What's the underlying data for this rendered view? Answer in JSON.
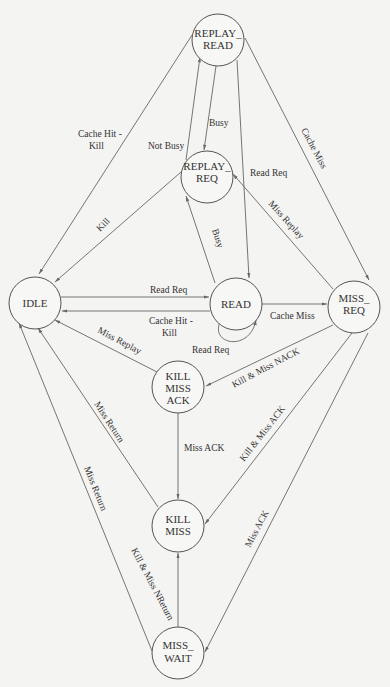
{
  "diagram": {
    "type": "state-machine",
    "nodes": {
      "replay_read": {
        "line1": "REPLAY_",
        "line2": "READ"
      },
      "replay_req": {
        "line1": "REPLAY_",
        "line2": "REQ"
      },
      "idle": {
        "line1": "IDLE"
      },
      "read": {
        "line1": "READ"
      },
      "miss_req": {
        "line1": "MISS_",
        "line2": "REQ"
      },
      "kill_miss_ack": {
        "line1": "KILL",
        "line2": "MISS",
        "line3": "ACK"
      },
      "kill_miss": {
        "line1": "KILL",
        "line2": "MISS"
      },
      "miss_wait": {
        "line1": "MISS_",
        "line2": "WAIT"
      }
    },
    "edges": [
      {
        "id": "rr_idle",
        "from": "REPLAY_READ",
        "to": "IDLE",
        "label1": "Cache Hit -",
        "label2": "Kill"
      },
      {
        "id": "rr_rq",
        "from": "REPLAY_READ",
        "to": "REPLAY_REQ",
        "label": "Busy"
      },
      {
        "id": "rq_rr",
        "from": "REPLAY_REQ",
        "to": "REPLAY_READ",
        "label": "Not Busy"
      },
      {
        "id": "rr_read",
        "from": "REPLAY_READ",
        "to": "READ",
        "label": "Read Req"
      },
      {
        "id": "rr_mreq",
        "from": "REPLAY_READ",
        "to": "MISS_REQ",
        "label": "Cache Miss"
      },
      {
        "id": "rq_idle",
        "from": "REPLAY_REQ",
        "to": "IDLE",
        "label": "Kill"
      },
      {
        "id": "read_rq",
        "from": "READ",
        "to": "REPLAY_REQ",
        "label": "Busy"
      },
      {
        "id": "mreq_rq",
        "from": "MISS_REQ",
        "to": "REPLAY_REQ",
        "label": "Miss Replay"
      },
      {
        "id": "idle_read",
        "from": "IDLE",
        "to": "READ",
        "label": "Read Req"
      },
      {
        "id": "read_idle",
        "from": "READ",
        "to": "IDLE",
        "label1": "Cache Hit -",
        "label2": "Kill"
      },
      {
        "id": "read_self",
        "from": "READ",
        "to": "READ",
        "label": "Read Req"
      },
      {
        "id": "read_mreq",
        "from": "READ",
        "to": "MISS_REQ",
        "label": "Cache Miss"
      },
      {
        "id": "kma_idle",
        "from": "KILL MISS ACK",
        "to": "IDLE",
        "label": "Miss Replay"
      },
      {
        "id": "mreq_kma",
        "from": "MISS_REQ",
        "to": "KILL MISS ACK",
        "label": "Kill & Miss NACK"
      },
      {
        "id": "kma_km",
        "from": "KILL MISS ACK",
        "to": "KILL MISS",
        "label": "Miss ACK"
      },
      {
        "id": "mreq_km",
        "from": "MISS_REQ",
        "to": "KILL MISS",
        "label": "Kill & Miss ACK"
      },
      {
        "id": "km_idle",
        "from": "KILL MISS",
        "to": "IDLE",
        "label": "Miss Return"
      },
      {
        "id": "mw_idle",
        "from": "MISS_WAIT",
        "to": "IDLE",
        "label": "Miss Return"
      },
      {
        "id": "mw_km",
        "from": "MISS_WAIT",
        "to": "KILL MISS",
        "label": "Kill & Miss NReturn"
      },
      {
        "id": "mreq_mw",
        "from": "MISS_REQ",
        "to": "MISS_WAIT",
        "label": "Miss ACK"
      }
    ],
    "edge_labels": {
      "rr_idle": {
        "label1": "Cache Hit -",
        "label2": "Kill"
      },
      "rr_rq": "Busy",
      "rq_rr": "Not Busy",
      "rr_read": "Read Req",
      "rr_mreq": "Cache Miss",
      "rq_idle": "Kill",
      "read_rq": "Busy",
      "mreq_rq": "Miss Replay",
      "idle_read": "Read Req",
      "read_idle": {
        "label1": "Cache Hit -",
        "label2": "Kill"
      },
      "read_self": "Read Req",
      "read_mreq": "Cache Miss",
      "kma_idle": "Miss Replay",
      "mreq_kma": "Kill & Miss NACK",
      "kma_km": "Miss ACK",
      "mreq_km": "Kill & Miss ACK",
      "km_idle": "Miss Return",
      "mw_idle": "Miss Return",
      "mw_km": "Kill & Miss NReturn",
      "mreq_mw": "Miss ACK"
    },
    "colors": {
      "background": "#f4f4f2",
      "stroke": "#555555",
      "text": "#333333"
    }
  }
}
